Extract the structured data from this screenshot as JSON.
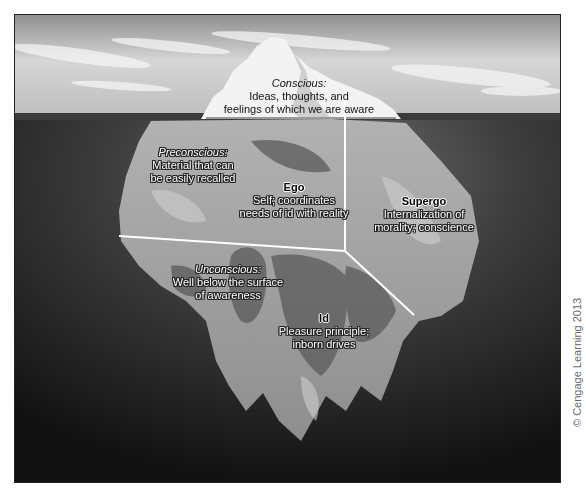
{
  "diagram": {
    "type": "iceberg-model-of-mind",
    "colors": {
      "sky_top": "#9a9a9a",
      "sky_bottom": "#d8d8d8",
      "horizon_band": "#3a3a3a",
      "water_top": "#6e6e6e",
      "water_bottom": "#141414",
      "ice_above": "#f2f2f2",
      "ice_submerged_light": "#a8a8a8",
      "ice_submerged_dark": "#555555",
      "divider_lines": "#ffffff"
    },
    "regions": {
      "conscious": {
        "title": "Conscious:",
        "line1": "Ideas, thoughts, and",
        "line2": "feelings of which we are aware"
      },
      "preconscious": {
        "title": "Preconscious:",
        "line1": "Material that can",
        "line2": "be easily recalled"
      },
      "ego": {
        "title": "Ego",
        "line1": "Self; coordinates",
        "line2": "needs of id with reality"
      },
      "supergo": {
        "title": "Supergo",
        "line1": "Internalization of",
        "line2": "morality; conscience"
      },
      "unconscious": {
        "title": "Unconscious:",
        "line1": "Well below the surface",
        "line2": "of awareness"
      },
      "id": {
        "title": "Id",
        "line1": "Pleasure principle;",
        "line2": "inborn drives"
      }
    }
  },
  "credit": {
    "text": "© Cengage Learning 2013"
  }
}
